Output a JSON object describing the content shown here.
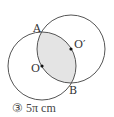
{
  "diagram": {
    "circle_o": {
      "cx": 42,
      "cy": 66,
      "r": 34,
      "label": "O"
    },
    "circle_o_prime": {
      "cx": 71,
      "cy": 49,
      "r": 34,
      "label": "O′"
    },
    "point_a": {
      "label": "A"
    },
    "point_b": {
      "label": "B"
    },
    "colors": {
      "stroke": "#555555",
      "shade": "#e4e4e4",
      "dot": "#111111"
    }
  },
  "caption": {
    "number": "③",
    "text": "5π cm"
  }
}
